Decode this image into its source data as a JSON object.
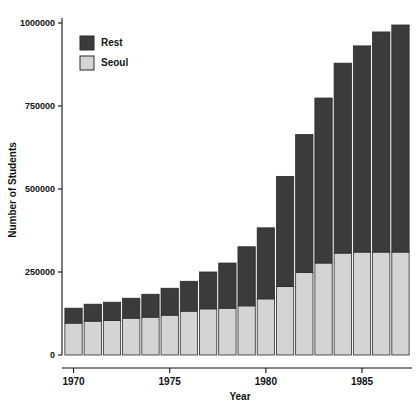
{
  "chart_data": {
    "type": "bar",
    "subtype": "stacked-vertical",
    "title": "",
    "xlabel": "Year",
    "ylabel": "Number of Students",
    "categories": [
      1970,
      1971,
      1972,
      1973,
      1974,
      1975,
      1976,
      1977,
      1978,
      1979,
      1980,
      1981,
      1982,
      1983,
      1984,
      1985,
      1986,
      1987
    ],
    "series": [
      {
        "name": "Seoul",
        "color": "#d4d4d4",
        "values": [
          96000,
          102000,
          104000,
          111000,
          114000,
          120000,
          132000,
          139000,
          141000,
          148000,
          169000,
          206000,
          249000,
          277000,
          307000,
          310000,
          310000,
          310000
        ]
      },
      {
        "name": "Rest",
        "color": "#3b3b3b",
        "values": [
          45000,
          51000,
          55000,
          60000,
          69000,
          81000,
          90000,
          111000,
          136000,
          178000,
          214000,
          332000,
          415000,
          497000,
          572000,
          621000,
          663000,
          684000
        ]
      }
    ],
    "totals": [
      141000,
      153000,
      159000,
      171000,
      183000,
      201000,
      222000,
      250000,
      277000,
      326000,
      383000,
      538000,
      664000,
      774000,
      879000,
      931000,
      973000,
      994000
    ],
    "ylim": [
      0,
      1030000
    ],
    "yticks": [
      0,
      250000,
      500000,
      750000,
      1000000
    ],
    "ytick_labels": [
      "0",
      "250000",
      "500000",
      "750000",
      "1000000"
    ],
    "xticks": [
      1970,
      1975,
      1980,
      1985
    ],
    "xtick_labels": [
      "1970",
      "1975",
      "1980",
      "1985"
    ],
    "xlim": [
      1969.4,
      1987.6
    ],
    "grid": false,
    "legend_position": "top-left",
    "legend_entries": [
      {
        "label": "Rest",
        "color": "#3b3b3b"
      },
      {
        "label": "Seoul",
        "color": "#d4d4d4"
      }
    ]
  }
}
